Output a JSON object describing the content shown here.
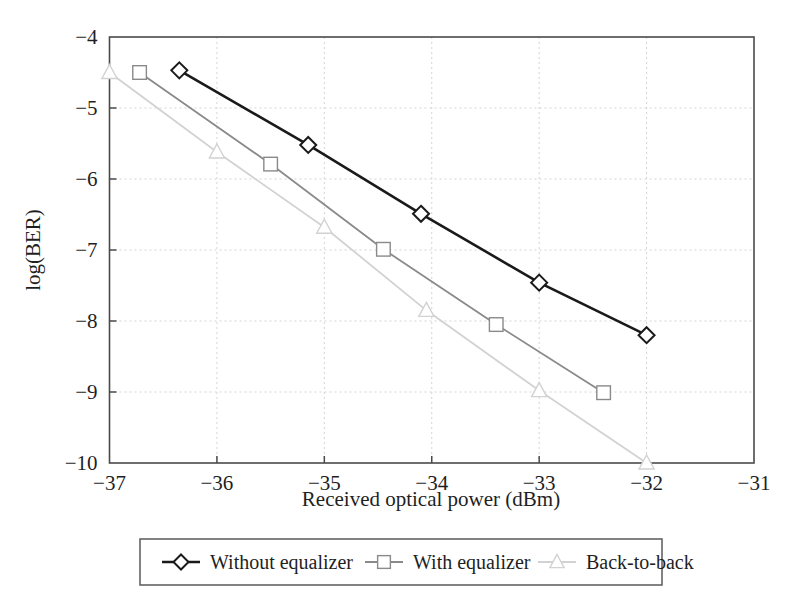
{
  "figure": {
    "background_color": "#ffffff"
  },
  "chart_data": {
    "type": "line",
    "title": "",
    "xlabel": "Received optical power (dBm)",
    "ylabel": "log(BER)",
    "xlim": [
      -37,
      -31
    ],
    "ylim": [
      -10,
      -4
    ],
    "xticks": [
      -37,
      -36,
      -35,
      -34,
      -33,
      -32,
      -31
    ],
    "xtick_labels": [
      "−37",
      "−36",
      "−35",
      "−34",
      "−33",
      "−32",
      "−31"
    ],
    "yticks": [
      -4,
      -5,
      -6,
      -7,
      -8,
      -9,
      -10
    ],
    "ytick_labels": [
      "−4",
      "−5",
      "−6",
      "−7",
      "−8",
      "−9",
      "−10"
    ],
    "grid": true,
    "grid_style": "dotted",
    "legend_position": "below-axes",
    "series": [
      {
        "name": "Without equalizer",
        "marker": "diamond",
        "color": "#1a1a1a",
        "line_width": 2.6,
        "x": [
          -36.35,
          -35.15,
          -34.1,
          -33.0,
          -32.0
        ],
        "y": [
          -4.47,
          -5.52,
          -6.49,
          -7.46,
          -8.2
        ]
      },
      {
        "name": "With equalizer",
        "marker": "square",
        "color": "#8a8a8a",
        "line_width": 1.8,
        "x": [
          -36.72,
          -35.5,
          -34.45,
          -33.4,
          -32.4
        ],
        "y": [
          -4.5,
          -5.79,
          -6.99,
          -8.05,
          -9.01
        ]
      },
      {
        "name": "Back-to-back",
        "marker": "triangle",
        "color": "#d2d2d2",
        "line_width": 1.8,
        "x": [
          -37.0,
          -36.0,
          -35.0,
          -34.05,
          -33.0,
          -32.0
        ],
        "y": [
          -4.5,
          -5.62,
          -6.68,
          -7.85,
          -8.98,
          -10.0
        ]
      }
    ]
  },
  "legend": {
    "entries": [
      {
        "label": "Without equalizer",
        "marker": "diamond-icon",
        "color": "#1a1a1a"
      },
      {
        "label": "With equalizer",
        "marker": "square-icon",
        "color": "#8a8a8a"
      },
      {
        "label": "Back-to-back",
        "marker": "triangle-icon",
        "color": "#d2d2d2"
      }
    ]
  }
}
